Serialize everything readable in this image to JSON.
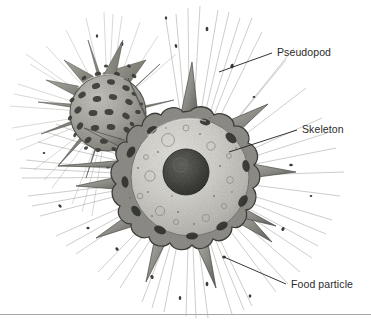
{
  "figure": {
    "background_color": "#ffffff",
    "label_color": "#2a2a2a",
    "rule_color": "#a8a8a8",
    "organisms": [
      {
        "name": "small-radiolarian",
        "description": "Perforated siliceous skeleton sphere with oval pores and radiating spines",
        "center": [
          108,
          113
        ],
        "radius": 38,
        "shell_color": "#9a9a96",
        "pore_color": "#3a3a38",
        "spine_count": 16,
        "pore_count": 34
      },
      {
        "name": "large-radiolarian",
        "description": "Sectioned cell showing lobed skeleton, granular cytoplasm, central nucleus and radiating axopods",
        "center": [
          190,
          177
        ],
        "radius": 66,
        "cytoplasm_color": "#cac9c4",
        "shell_color": "#8e8e8a",
        "nucleus_color": "#4a4a47",
        "nucleus_center": [
          186,
          172
        ],
        "nucleus_radius": 23,
        "lobe_count": 16,
        "spine_count": 11,
        "axopod_count": 48
      }
    ],
    "labels": [
      {
        "id": "pseudopod",
        "text": "Pseudopod",
        "text_x": 277,
        "text_y": 46,
        "leader_from": [
          272,
          53
        ],
        "leader_to": [
          219,
          72
        ]
      },
      {
        "id": "skeleton",
        "text": "Skeleton",
        "text_x": 302,
        "text_y": 123,
        "leader_from": [
          297,
          130
        ],
        "leader_to": [
          229,
          152
        ]
      },
      {
        "id": "food-particle",
        "text": "Food particle",
        "text_x": 291,
        "text_y": 278,
        "leader_from": [
          286,
          284
        ],
        "leader_to": [
          224,
          257
        ]
      }
    ]
  }
}
